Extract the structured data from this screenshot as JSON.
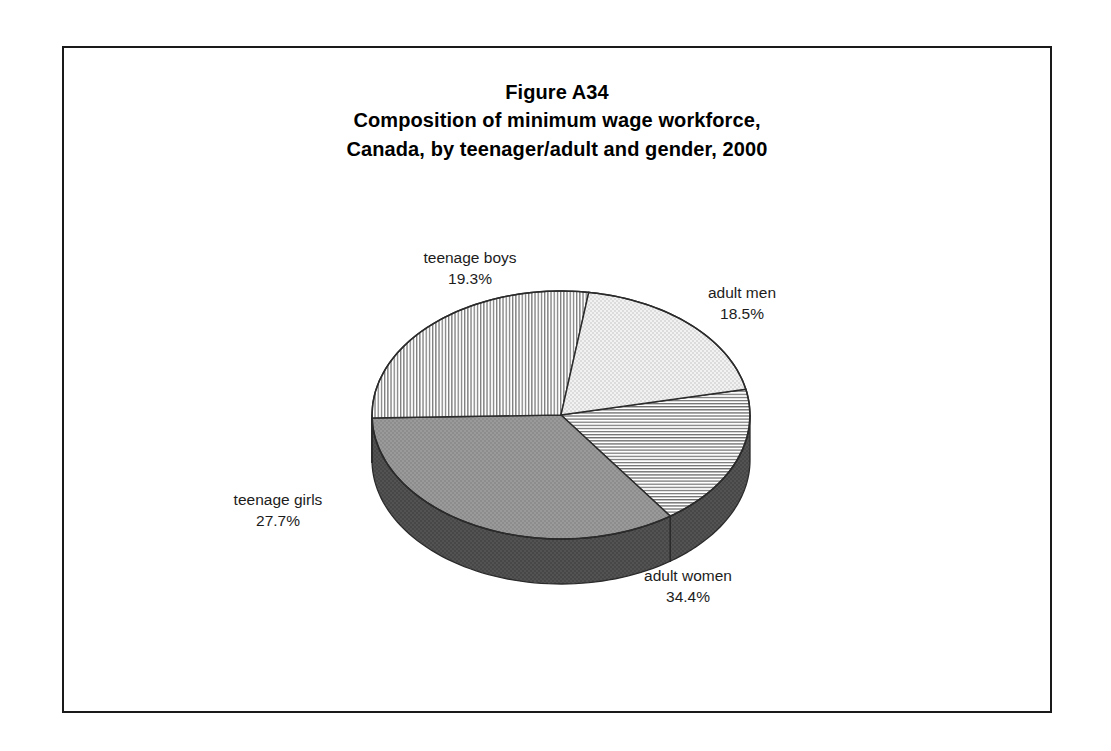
{
  "figure": {
    "title_lines": [
      "Figure A34",
      "Composition of minimum wage workforce,",
      "Canada, by teenager/adult and gender, 2000"
    ],
    "title_line_1": "Figure A34",
    "title_line_2": "Composition of minimum wage workforce,",
    "title_line_3": "Canada, by teenager/adult and gender, 2000"
  },
  "labels": {
    "teenage_boys": {
      "name": "teenage boys",
      "pct": "19.3%"
    },
    "adult_men": {
      "name": "adult men",
      "pct": "18.5%"
    },
    "teenage_girls": {
      "name": "teenage girls",
      "pct": "27.7%"
    },
    "adult_women": {
      "name": "adult women",
      "pct": "34.4%"
    }
  },
  "chart_data": {
    "type": "pie",
    "subtitle": "Canada, by teenager/adult and gender, 2000",
    "xlabel": "",
    "ylabel": "",
    "grid": false,
    "legend": "none (direct slice labels)",
    "three_d": true,
    "start_angle_deg": -12,
    "direction": "clockwise",
    "units": "percent",
    "categories": [
      "adult men",
      "adult women",
      "teenage girls",
      "teenage boys"
    ],
    "values": [
      18.5,
      34.4,
      27.7,
      19.3
    ],
    "labels": [
      "18.5%",
      "34.4%",
      "27.7%",
      "19.3%"
    ],
    "slices": [
      {
        "label": "adult men",
        "value": 18.5,
        "text": "18.5%",
        "fill": "horizontal-hatch",
        "color": "#ffffff"
      },
      {
        "label": "adult women",
        "value": 34.4,
        "text": "34.4%",
        "fill": "solid-gray",
        "color": "#959595"
      },
      {
        "label": "teenage girls",
        "value": 27.7,
        "text": "27.7%",
        "fill": "vertical-hatch",
        "color": "#ffffff"
      },
      {
        "label": "teenage boys",
        "value": 19.3,
        "text": "19.3%",
        "fill": "light-gray",
        "color": "#e9e9e9"
      }
    ],
    "total": 99.9
  },
  "colors": {
    "frame": "#1a1a1a",
    "outline": "#2b2b2b",
    "background": "#ffffff",
    "adult_women_top": "#959595",
    "adult_women_side": "#4d4d4d",
    "teenage_boys_top": "#e9e9e9",
    "teenage_girls_top": "#ffffff",
    "adult_men_top": "#ffffff",
    "text": "#1c1c1c"
  }
}
